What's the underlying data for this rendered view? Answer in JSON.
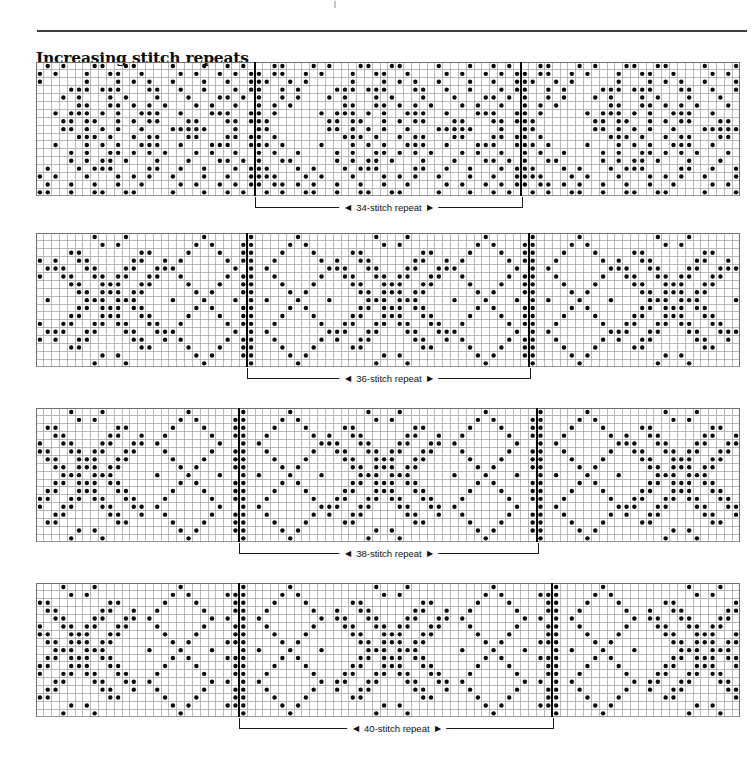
{
  "page": {
    "heading": "Increasing stitch repeats"
  },
  "icons": {
    "left_arrow": "◀",
    "right_arrow": "▶"
  },
  "colors": {
    "dot": "#0a0a0a",
    "grid_line": "#a3a3a3",
    "outer_border": "#707070",
    "bold_line": "#0a0a0a",
    "rule": "#3d3d3d",
    "text": "#111111"
  },
  "grid": {
    "left": 36,
    "cell_w": 7.822,
    "cell_h": 7.9,
    "dot_radius": 2.2
  },
  "charts": [
    {
      "id": "chart-34",
      "label": "34-stitch repeat",
      "repeat_stitches": 34,
      "rows": 17,
      "total_cols": 90,
      "repeat_start_col": 28,
      "top": 62,
      "pattern": [
        "..XX...X.X...XX..XX....X...X..X.X.",
        "X.XX..X.X...X..XX..X....X.X..X.X.X",
        "XX..X.X.....X...X.X.X..X...X..X..X",
        "X..X.X....XXX.XXX...XX..X..X...X.X",
        "X..X.X...X.X...X.X...X...X...XX.X.",
        "X.X.X......XX..XX.X.X.X...X.X..X..",
        "X.X.....X.XXX.X.X..XXX..X...XXX..X",
        "XX.......XX.XX..X.X.XX...XX...XX.X",
        "XX.......XX.X.X.X..X...XXXXX...X..",
        "X.X........XXX.X..X.XX...XX...XX.X",
        "XX.X....X...X.X.X..XXX..X...XXX..X",
        "X.X..X....X.X..XX.X.X.X...X.X..X..",
        "X..XX.....X.X.XX.X...X...X...XX.X.",
        "XX...X.X...X.XXX....XX..X..X...X.X",
        "XXX...X.X...X...X.X.X..X...X..X..X",
        "X.XX.X.X..X..X..X..X....X.X..X.X.X",
        ".X.X..XX..X..XX..XX....X...X..X.X."
      ]
    },
    {
      "id": "chart-36",
      "label": "36-stitch repeat",
      "repeat_stitches": 36,
      "rows": 17,
      "total_cols": 90,
      "repeat_start_col": 27,
      "top": 233,
      "pattern": [
        "X.....X.........X...X.........X.....",
        "X....X.X.........X.X.........X.X...X",
        "X...X...X....XX.......XX....X...X..X",
        "X..X.....X.X..XX.....XX..X.X.....X.X",
        "X.X.......XXX..XX...XX..XXX.......X.",
        "X..X.....X..XX..XX.XX..XX..X.....X.X",
        "X...X...X....XX..XXX..XX....X...X..X",
        "X....X.X......XX.XXX.XX......X.X...X",
        "X.X...X...X....XXX.XXX....X...X...X.",
        "X....X.X......XX.XXX.XX......X.X...X",
        "X...X...X....XX..XXX..XX....X...X..X",
        "X..X.....X..XX..XX.XX..XX..X.....X.X",
        "X.X.......XXX..XX...XX..XXX.......X.",
        "X..X.....X.X..XX.....XX..X.X.....X.X",
        "X...X...X....XX.......XX....X...X..X",
        "X....X.X.........X.X.........X.X...X",
        "X.....X.........X...X.........X....."
      ]
    },
    {
      "id": "chart-38",
      "label": "38-stitch repeat",
      "repeat_stitches": 38,
      "rows": 17,
      "total_cols": 90,
      "repeat_start_col": 26,
      "top": 408,
      "pattern": [
        "X.....X.........X...X..........X......",
        "X....X.X.........X.X..........X.X....X",
        "X...X...X....XX.......XX.....X...X...X",
        "X..X.....X.X..XX.....XX..X..X.....X..X",
        "X.X.......XXX..XX...XX..XX.X.......X..",
        "X..X.....X..XX..XX.XX..XX...X.....X..X",
        "X...X...X....XX..XXX..XX.....X...X...X",
        "X....X.X......XX.XXX.XX.......X.X....X",
        "X.X...X...X....XXX.XXX.....X...X...X..",
        "X....X.X......XX.XXX.XX.......X.X....X",
        "X...X...X....XX..XXX..XX.....X...X...X",
        "X..X.....X..XX..XX.XX..XX...X.....X..X",
        "X.X.......XXX..XX...XX..XX.X.......X..",
        "X..X.....X.X..XX.....XX..X..X.....X..X",
        "X...X...X....XX.......XX.....X...X...X",
        "X....X.X.........X.X..........X.X....X",
        "X.....X.........X...X..........X......"
      ]
    },
    {
      "id": "chart-40",
      "label": "40-stitch repeat",
      "repeat_stitches": 40,
      "rows": 17,
      "total_cols": 90,
      "repeat_start_col": 26,
      "top": 583,
      "pattern": [
        "X.....X..........X...X..........X.......",
        "X....X.X..........X.X..........X.X....XX",
        "X...X...X.....XX.......XX.....X...X....X",
        "X..X.....X..X..XX.....XX..X..X.....X...X",
        "X.X.......X.XX..XX...XX..XX.X.......X.X.",
        "X..X.....X...XX..XX.XX..XX...X.....X...X",
        "X...X...X.....XX..XXX..XX.....X...X....X",
        "X....X.X.......XX.XXX.XX.......X.X....XX",
        "X.X...X...X.....XXX.XXX.....X...X...X...",
        "X....X.X.......XX.XXX.XX.......X.X....XX",
        "X...X...X.....XX..XXX..XX.....X...X....X",
        "X..X.....X...XX..XX.XX..XX...X.....X...X",
        "X.X.......X.XX..XX...XX..XX.X.......X.X.",
        "X..X.....X..X..XX.....XX..X..X.....X...X",
        "X...X...X.....XX.......XX.....X...X....X",
        "X....X.X..........X.X..........X.X....XX",
        "X.....X..........X...X..........X......."
      ]
    }
  ]
}
